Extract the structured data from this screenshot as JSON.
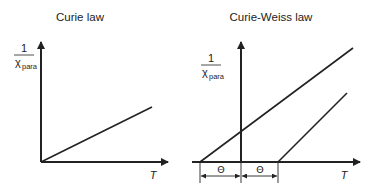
{
  "panels": [
    {
      "title": "Curie law",
      "y_label": {
        "numerator": "1",
        "symbol": "χ",
        "subscript": "para"
      },
      "x_label": "T"
    },
    {
      "title": "Curie-Weiss law",
      "y_label": {
        "numerator": "1",
        "symbol": "χ",
        "subscript": "para"
      },
      "x_label": "T",
      "dimension_labels": [
        "Θ",
        "Θ"
      ]
    }
  ],
  "colors": {
    "ink": "#222222",
    "background": "#ffffff"
  }
}
